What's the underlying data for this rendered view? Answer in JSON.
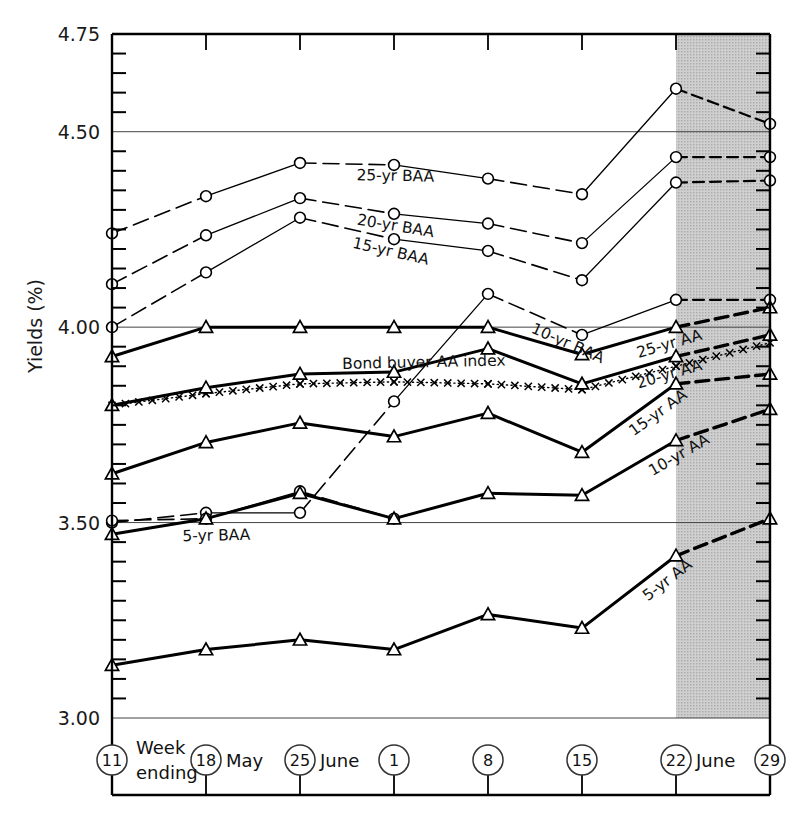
{
  "chart_data": {
    "type": "line",
    "title": "",
    "ylabel": "Yields (%)",
    "xlabel": "Week ending",
    "ylim": [
      3.0,
      4.75
    ],
    "y_ticks_major": [
      "4.75",
      "4.50",
      "4.00",
      "3.50",
      "3.00"
    ],
    "y_major_values": [
      4.75,
      4.5,
      4.0,
      3.5,
      3.0
    ],
    "y_minor_step": 0.05,
    "grid": "horizontal-major-only",
    "legend_position": "inline-labels",
    "x": [
      "11",
      "18",
      "25",
      "1",
      "8",
      "15",
      "22",
      "29"
    ],
    "x_month_labels": [
      {
        "after": "18",
        "text": "May"
      },
      {
        "after": "25",
        "text": "June"
      },
      {
        "after": "22",
        "text": "June"
      }
    ],
    "forecast_region": {
      "from": "22",
      "to": "29",
      "shaded": true,
      "fill": "#c9c9c9"
    },
    "series": [
      {
        "name": "25-yr BAA",
        "marker": "circle",
        "style": "thin-dashdot",
        "values": [
          4.24,
          4.335,
          4.42,
          4.415,
          4.38,
          4.34,
          4.61,
          4.52
        ],
        "label_at": 2.6,
        "label_dy": 16
      },
      {
        "name": "20-yr BAA",
        "marker": "circle",
        "style": "thin-dashdot",
        "values": [
          4.11,
          4.235,
          4.33,
          4.29,
          4.265,
          4.215,
          4.435,
          4.435
        ],
        "label_at": 2.6,
        "label_dy": 17
      },
      {
        "name": "15-yr BAA",
        "marker": "circle",
        "style": "thin-dashdot",
        "values": [
          4.0,
          4.14,
          4.28,
          4.225,
          4.195,
          4.12,
          4.37,
          4.375
        ],
        "label_at": 2.55,
        "label_dy": 18
      },
      {
        "name": "10-yr BAA",
        "marker": "circle",
        "style": "thin-dashdot",
        "values": [
          3.5,
          3.525,
          3.525,
          3.81,
          4.085,
          3.98,
          4.07,
          4.07
        ],
        "label_at": 4.45,
        "label_dy": 20
      },
      {
        "name": "5-yr BAA",
        "marker": "circle",
        "style": "thin-dashdot",
        "values": [
          3.505,
          3.51,
          3.58,
          3.51,
          3.52,
          3.52,
          3.52,
          3.52
        ],
        "label_at": 0.75,
        "label_dy": 22,
        "truncate_at": 4
      },
      {
        "name": "Bond buyer AA index",
        "marker": "cross",
        "style": "dotted-cross",
        "values": [
          3.8,
          3.83,
          3.855,
          3.86,
          3.855,
          3.84,
          3.9,
          3.96
        ],
        "label_at": 2.45,
        "label_dy": -14
      },
      {
        "name": "25-yr AA",
        "marker": "triangle",
        "style": "thick-solid",
        "values": [
          3.925,
          4.0,
          4.0,
          4.0,
          4.0,
          3.93,
          4.0,
          4.05
        ],
        "label_at": 5.6,
        "label_dy": 20
      },
      {
        "name": "20-yr AA",
        "marker": "triangle",
        "style": "thick-solid",
        "values": [
          3.8,
          3.845,
          3.88,
          3.885,
          3.945,
          3.855,
          3.925,
          3.98
        ],
        "label_at": 5.6,
        "label_dy": 21
      },
      {
        "name": "15-yr AA",
        "marker": "triangle",
        "style": "thick-solid",
        "values": [
          3.625,
          3.705,
          3.755,
          3.72,
          3.78,
          3.68,
          3.855,
          3.88
        ],
        "label_at": 5.55,
        "label_dy": 22
      },
      {
        "name": "10-yr AA",
        "marker": "triangle",
        "style": "thick-solid",
        "values": [
          3.47,
          3.51,
          3.575,
          3.51,
          3.575,
          3.57,
          3.71,
          3.79
        ],
        "label_at": 5.75,
        "label_dy": 22
      },
      {
        "name": "5-yr AA",
        "marker": "triangle",
        "style": "thick-solid",
        "values": [
          3.135,
          3.175,
          3.2,
          3.175,
          3.265,
          3.23,
          3.415,
          3.51
        ],
        "label_at": 5.7,
        "label_dy": 24
      }
    ]
  },
  "axis": {
    "y_title": "Yields (%)",
    "x_title_line1": "Week",
    "x_title_line2": "ending"
  }
}
